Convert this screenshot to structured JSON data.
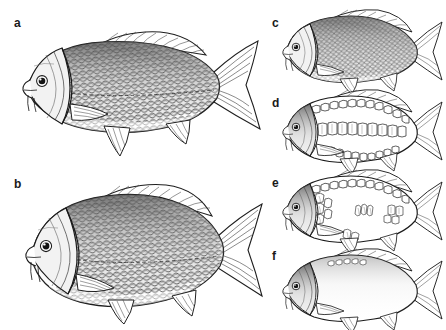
{
  "figure": {
    "background_color": "#ffffff",
    "ink_color": "#1a1a1a",
    "style": "black and white pen-and-ink scientific illustration"
  },
  "panels": [
    {
      "label": "a",
      "name": "scaled-carp-elongate",
      "description": "fully scaled common carp, elongate wild-type body",
      "body_form": "elongate",
      "scale_coverage": "full",
      "barbels": 2,
      "dorsal_fin": "long",
      "caudal_fin": "forked"
    },
    {
      "label": "b",
      "name": "scaled-carp-deep-bodied",
      "description": "fully scaled carp with deep high-backed body",
      "body_form": "deep-bodied",
      "scale_coverage": "full",
      "barbels": 2,
      "dorsal_fin": "long",
      "caudal_fin": "forked"
    },
    {
      "label": "c",
      "name": "scaled-carp-small",
      "description": "fully scaled carp, smaller scale illustration",
      "body_form": "deep-bodied",
      "scale_coverage": "full",
      "barbels": 2,
      "dorsal_fin": "long",
      "caudal_fin": "forked"
    },
    {
      "label": "d",
      "name": "mirror-carp-row-scaled",
      "description": "mirror carp with enlarged scales in dorsal, lateral and ventral rows on bare skin",
      "body_form": "deep-bodied",
      "scale_coverage": "rows",
      "barbels": 2,
      "dorsal_fin": "long",
      "caudal_fin": "forked"
    },
    {
      "label": "e",
      "name": "line-carp-sparse-scaled",
      "description": "line carp with a dorsal scale row and scattered isolated scale clusters",
      "body_form": "deep-bodied",
      "scale_coverage": "sparse",
      "barbels": 2,
      "dorsal_fin": "long",
      "caudal_fin": "forked"
    },
    {
      "label": "f",
      "name": "leather-carp-naked",
      "description": "leather carp, essentially scaleless naked skin",
      "body_form": "deep-bodied",
      "scale_coverage": "none",
      "barbels": 2,
      "dorsal_fin": "long",
      "caudal_fin": "forked"
    }
  ]
}
